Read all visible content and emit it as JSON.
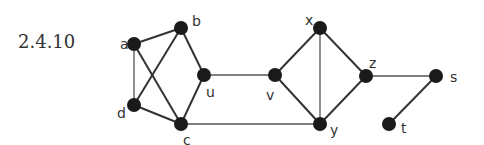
{
  "figure_label": "2.4.10",
  "colors": {
    "node": "#1a1a1a",
    "edge": "#333333",
    "text": "#333333"
  },
  "nodes": [
    {
      "id": "a",
      "label": "a",
      "x": 134,
      "y": 44,
      "lx": 120,
      "ly": 49
    },
    {
      "id": "b",
      "label": "b",
      "x": 181,
      "y": 28,
      "lx": 192,
      "ly": 26
    },
    {
      "id": "u",
      "label": "u",
      "x": 204,
      "y": 75,
      "lx": 206,
      "ly": 97
    },
    {
      "id": "d",
      "label": "d",
      "x": 134,
      "y": 105,
      "lx": 117,
      "ly": 118
    },
    {
      "id": "c",
      "label": "c",
      "x": 181,
      "y": 124,
      "lx": 183,
      "ly": 145
    },
    {
      "id": "v",
      "label": "v",
      "x": 275,
      "y": 75,
      "lx": 266,
      "ly": 100
    },
    {
      "id": "x",
      "label": "x",
      "x": 320,
      "y": 28,
      "lx": 305,
      "ly": 25
    },
    {
      "id": "z",
      "label": "z",
      "x": 366,
      "y": 76,
      "lx": 369,
      "ly": 68
    },
    {
      "id": "y",
      "label": "y",
      "x": 320,
      "y": 124,
      "lx": 330,
      "ly": 135
    },
    {
      "id": "s",
      "label": "s",
      "x": 436,
      "y": 76,
      "lx": 450,
      "ly": 82
    },
    {
      "id": "t",
      "label": "t",
      "x": 389,
      "y": 124,
      "lx": 401,
      "ly": 133
    }
  ],
  "edges": [
    {
      "from": "a",
      "to": "b",
      "w": "thick"
    },
    {
      "from": "a",
      "to": "d",
      "w": "thin"
    },
    {
      "from": "a",
      "to": "c",
      "w": "thick"
    },
    {
      "from": "b",
      "to": "d",
      "w": "thick"
    },
    {
      "from": "b",
      "to": "u",
      "w": "thick"
    },
    {
      "from": "u",
      "to": "c",
      "w": "thick"
    },
    {
      "from": "d",
      "to": "c",
      "w": "thick"
    },
    {
      "from": "u",
      "to": "v",
      "w": "thin"
    },
    {
      "from": "c",
      "to": "y",
      "w": "thin"
    },
    {
      "from": "v",
      "to": "x",
      "w": "thick"
    },
    {
      "from": "v",
      "to": "y",
      "w": "thick"
    },
    {
      "from": "x",
      "to": "y",
      "w": "thin"
    },
    {
      "from": "x",
      "to": "z",
      "w": "thick"
    },
    {
      "from": "z",
      "to": "y",
      "w": "thick"
    },
    {
      "from": "z",
      "to": "s",
      "w": "thin"
    },
    {
      "from": "s",
      "to": "t",
      "w": "thick"
    }
  ]
}
